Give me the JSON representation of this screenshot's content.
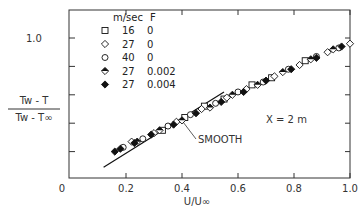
{
  "chart_data": {
    "type": "scatter",
    "title": "",
    "xlabel": "U/U∞",
    "ylabel": "(Tw - T) / (Tw - T∞)",
    "ylabel_parts": {
      "numerator": "Tw - T",
      "denominator": "Tw - T∞"
    },
    "xlim": [
      0,
      1.0
    ],
    "ylim": [
      0,
      1.2
    ],
    "x_ticks": [
      0.2,
      0.4,
      0.6,
      0.8,
      1.0
    ],
    "x_tick_labels": [
      "0",
      "0.2",
      "0.4",
      "0.6",
      "0.8",
      "1.0"
    ],
    "y_ticks": [
      0.2,
      0.4,
      0.6,
      0.8,
      1.0
    ],
    "y_tick_labels": [
      "1.0"
    ],
    "origin_label": "0",
    "grid": false,
    "annotation": "X = 2 m",
    "legend": {
      "position": "upper-left",
      "header": [
        "m/sec",
        "F"
      ],
      "entries": [
        {
          "marker": "open-square",
          "speed": "16",
          "F": "0"
        },
        {
          "marker": "open-diamond",
          "speed": "27",
          "F": "0"
        },
        {
          "marker": "open-circle",
          "speed": "40",
          "F": "0"
        },
        {
          "marker": "half-filled-diamond",
          "speed": "27",
          "F": "0.002"
        },
        {
          "marker": "filled-diamond",
          "speed": "27",
          "F": "0.004"
        }
      ]
    },
    "smooth_curve": {
      "label": "SMOOTH",
      "x": [
        0.12,
        0.55
      ],
      "y": [
        0.09,
        0.62
      ]
    },
    "series": [
      {
        "name": "16 m/sec, F=0",
        "marker": "open-square",
        "x": [
          0.33,
          0.41,
          0.48,
          0.55,
          0.65,
          0.72,
          0.84
        ],
        "y": [
          0.35,
          0.44,
          0.52,
          0.57,
          0.67,
          0.72,
          0.84
        ]
      },
      {
        "name": "27 m/sec, F=0",
        "marker": "open-diamond",
        "x": [
          0.22,
          0.3,
          0.38,
          0.47,
          0.56,
          0.63,
          0.73,
          0.82,
          0.92,
          1.0
        ],
        "y": [
          0.27,
          0.33,
          0.41,
          0.5,
          0.58,
          0.64,
          0.73,
          0.81,
          0.9,
          0.96
        ]
      },
      {
        "name": "40 m/sec, F=0",
        "marker": "open-circle",
        "x": [
          0.19,
          0.26,
          0.35,
          0.43,
          0.52,
          0.6,
          0.69,
          0.78,
          0.88,
          0.96
        ],
        "y": [
          0.23,
          0.29,
          0.38,
          0.46,
          0.54,
          0.62,
          0.69,
          0.78,
          0.87,
          0.93
        ]
      },
      {
        "name": "27 m/sec, F=0.002",
        "marker": "half-filled-diamond",
        "x": [
          0.24,
          0.32,
          0.4,
          0.5,
          0.58,
          0.67,
          0.76,
          0.86,
          0.94
        ],
        "y": [
          0.27,
          0.35,
          0.42,
          0.51,
          0.6,
          0.67,
          0.76,
          0.85,
          0.92
        ]
      },
      {
        "name": "27 m/sec, F=0.004",
        "marker": "filled-diamond",
        "x": [
          0.16,
          0.18,
          0.23,
          0.29,
          0.37,
          0.45,
          0.54,
          0.62,
          0.7,
          0.79,
          0.88,
          0.97
        ],
        "y": [
          0.2,
          0.22,
          0.26,
          0.32,
          0.39,
          0.47,
          0.55,
          0.62,
          0.7,
          0.78,
          0.86,
          0.94
        ]
      }
    ]
  }
}
